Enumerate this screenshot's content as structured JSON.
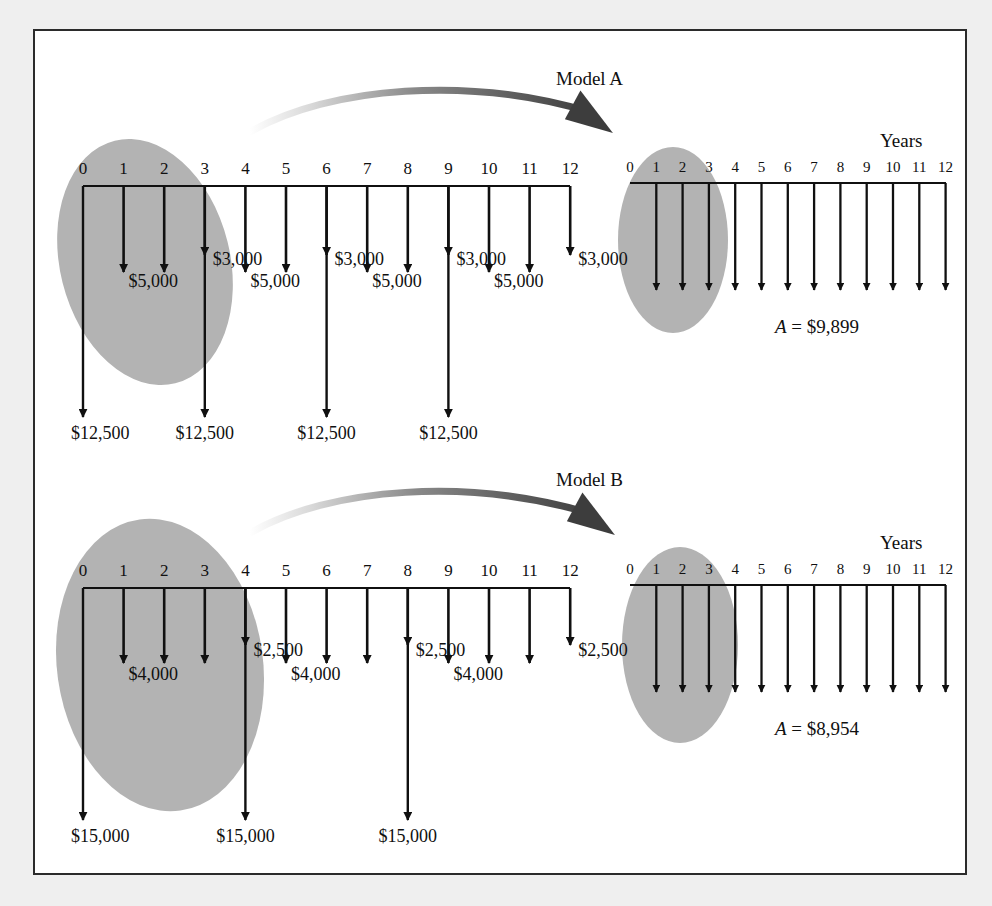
{
  "figure": {
    "background_color": "#efefef",
    "panel_color": "#ffffff",
    "border_color": "#2b2b2b",
    "ellipse_color": "#b3b3b3",
    "line_color": "#101010"
  },
  "models": [
    {
      "id": "model-a",
      "title": "Model A",
      "years_label": "Years",
      "left_diagram": {
        "tick_labels": [
          "0",
          "1",
          "2",
          "3",
          "4",
          "5",
          "6",
          "7",
          "8",
          "9",
          "10",
          "11",
          "12"
        ],
        "short_arrow_years": [
          3,
          6,
          9,
          12
        ],
        "short_arrow_label": "$3,000",
        "short_arrow_label_years": [
          3,
          6,
          9,
          12
        ],
        "medium_arrow_years": [
          1,
          2,
          4,
          5,
          7,
          8,
          10,
          11
        ],
        "medium_arrow_label": "$5,000",
        "medium_arrow_label_years": [
          1,
          4,
          7,
          10
        ],
        "long_arrow_years": [
          0,
          3,
          6,
          9
        ],
        "long_arrow_label": "$12,500",
        "long_arrow_label_years": [
          0,
          3,
          6,
          9
        ]
      },
      "right_diagram": {
        "tick_labels": [
          "0",
          "1",
          "2",
          "3",
          "4",
          "5",
          "6",
          "7",
          "8",
          "9",
          "10",
          "11",
          "12"
        ],
        "arrow_years": [
          1,
          2,
          3,
          4,
          5,
          6,
          7,
          8,
          9,
          10,
          11,
          12
        ],
        "result_label": "A",
        "result_equals": "=",
        "result_value": "$9,899"
      }
    },
    {
      "id": "model-b",
      "title": "Model B",
      "years_label": "Years",
      "left_diagram": {
        "tick_labels": [
          "0",
          "1",
          "2",
          "3",
          "4",
          "5",
          "6",
          "7",
          "8",
          "9",
          "10",
          "11",
          "12"
        ],
        "short_arrow_years": [
          4,
          8,
          12
        ],
        "short_arrow_label": "$2,500",
        "short_arrow_label_years": [
          4,
          8,
          12
        ],
        "medium_arrow_years": [
          1,
          2,
          3,
          5,
          6,
          7,
          9,
          10,
          11
        ],
        "medium_arrow_label": "$4,000",
        "medium_arrow_label_years": [
          1,
          5,
          9
        ],
        "long_arrow_years": [
          0,
          4,
          8
        ],
        "long_arrow_label": "$15,000",
        "long_arrow_label_years": [
          0,
          4,
          8
        ]
      },
      "right_diagram": {
        "tick_labels": [
          "0",
          "1",
          "2",
          "3",
          "4",
          "5",
          "6",
          "7",
          "8",
          "9",
          "10",
          "11",
          "12"
        ],
        "arrow_years": [
          1,
          2,
          3,
          4,
          5,
          6,
          7,
          8,
          9,
          10,
          11,
          12
        ],
        "result_label": "A",
        "result_equals": "=",
        "result_value": "$8,954"
      }
    }
  ],
  "chart_data": {
    "type": "bar",
    "xlabel": "Years",
    "ylabel": "Cash outflow ($)",
    "categories": [
      "0",
      "1",
      "2",
      "3",
      "4",
      "5",
      "6",
      "7",
      "8",
      "9",
      "10",
      "11",
      "12"
    ],
    "series": [
      {
        "name": "Model A original cash flows",
        "values": [
          12500,
          5000,
          5000,
          15500,
          5000,
          5000,
          15500,
          5000,
          5000,
          15500,
          5000,
          5000,
          3000
        ],
        "components": {
          "annual_operating": [
            0,
            5000,
            5000,
            3000,
            5000,
            5000,
            3000,
            5000,
            5000,
            3000,
            5000,
            5000,
            3000
          ],
          "periodic_overhaul": [
            12500,
            0,
            0,
            12500,
            0,
            0,
            12500,
            0,
            0,
            12500,
            0,
            0,
            0
          ]
        }
      },
      {
        "name": "Model A equivalent uniform series",
        "values": [
          0,
          9899,
          9899,
          9899,
          9899,
          9899,
          9899,
          9899,
          9899,
          9899,
          9899,
          9899,
          9899
        ]
      },
      {
        "name": "Model B original cash flows",
        "values": [
          15000,
          4000,
          4000,
          4000,
          17500,
          4000,
          4000,
          4000,
          17500,
          4000,
          4000,
          4000,
          2500
        ],
        "components": {
          "annual_operating": [
            0,
            4000,
            4000,
            4000,
            2500,
            4000,
            4000,
            4000,
            2500,
            4000,
            4000,
            4000,
            2500
          ],
          "periodic_overhaul": [
            15000,
            0,
            0,
            0,
            15000,
            0,
            0,
            0,
            15000,
            0,
            0,
            0,
            0
          ]
        }
      },
      {
        "name": "Model B equivalent uniform series",
        "values": [
          0,
          8954,
          8954,
          8954,
          8954,
          8954,
          8954,
          8954,
          8954,
          8954,
          8954,
          8954,
          8954
        ]
      }
    ],
    "annotations": [
      "Model A",
      "Model B",
      "A = $9,899",
      "A = $8,954",
      "Years"
    ],
    "grid": false,
    "legend": "none"
  }
}
